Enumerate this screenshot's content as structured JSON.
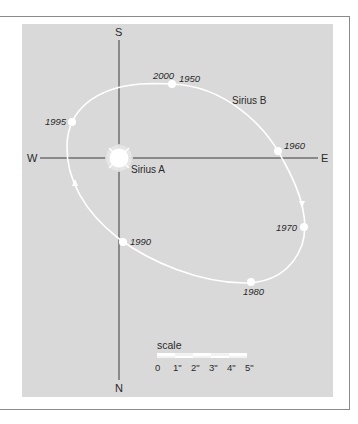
{
  "diagram": {
    "colors": {
      "background": "#ffffff",
      "panel": "#d9d9d9",
      "frame": "#8a8a8a",
      "axes": "#3a3a3a",
      "orbit": "#ffffff",
      "text": "#2a2a2a"
    },
    "compass": {
      "top": "S",
      "bottom": "N",
      "left": "W",
      "right": "E"
    },
    "stars": {
      "primary": "Sirius A",
      "companion": "Sirius B"
    },
    "orbit_points": [
      {
        "year": "2000",
        "x": 172,
        "y": 84
      },
      {
        "year": "1950",
        "x": 172,
        "y": 84
      },
      {
        "year": "1960",
        "x": 278,
        "y": 151
      },
      {
        "year": "1970",
        "x": 304,
        "y": 227
      },
      {
        "year": "1980",
        "x": 251,
        "y": 282
      },
      {
        "year": "1990",
        "x": 123,
        "y": 242
      },
      {
        "year": "1995",
        "x": 72,
        "y": 122
      }
    ],
    "direction_arrows": [
      {
        "position": "right side",
        "direction": "down"
      },
      {
        "position": "left side",
        "direction": "up"
      }
    ],
    "scale": {
      "label": "scale",
      "ticks": [
        "0",
        "1\"",
        "2\"",
        "3\"",
        "4\"",
        "5\""
      ]
    }
  }
}
